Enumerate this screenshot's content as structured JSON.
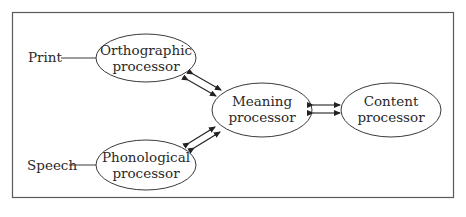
{
  "diagram": {
    "inputs": [
      {
        "id": "print",
        "label": "Print"
      },
      {
        "id": "speech",
        "label": "Speech"
      }
    ],
    "nodes": [
      {
        "id": "orthographic",
        "line1": "Orthographic",
        "line2": "processor"
      },
      {
        "id": "phonological",
        "line1": "Phonological",
        "line2": "processor"
      },
      {
        "id": "meaning",
        "line1": "Meaning",
        "line2": "processor"
      },
      {
        "id": "content",
        "line1": "Content",
        "line2": "processor"
      }
    ],
    "edges": [
      {
        "from": "print",
        "to": "orthographic",
        "type": "line"
      },
      {
        "from": "speech",
        "to": "phonological",
        "type": "line"
      },
      {
        "from": "orthographic",
        "to": "meaning",
        "type": "bidirectional-double-arrow"
      },
      {
        "from": "phonological",
        "to": "meaning",
        "type": "bidirectional-double-arrow"
      },
      {
        "from": "meaning",
        "to": "content",
        "type": "bidirectional-double-arrow"
      }
    ],
    "colors": {
      "stroke": "#3a3a3a",
      "text": "#2a2a2a",
      "background": "#ffffff"
    }
  }
}
